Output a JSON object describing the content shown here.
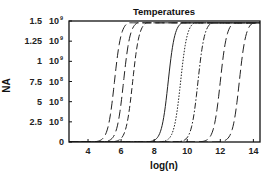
{
  "chart_data": {
    "type": "line",
    "title": "Temperatures",
    "xlabel": "log(n)",
    "ylabel": "NA",
    "xlim": [
      2.85,
      14.4
    ],
    "ylim": [
      0,
      1500000000
    ],
    "grid": false,
    "legend": null,
    "x_ticks": [
      {
        "value": 4,
        "label": "4"
      },
      {
        "value": 6,
        "label": "6"
      },
      {
        "value": 8,
        "label": "8"
      },
      {
        "value": 10,
        "label": "10"
      },
      {
        "value": 12,
        "label": "12"
      },
      {
        "value": 14,
        "label": "14"
      }
    ],
    "y_ticks": [
      {
        "value": 0,
        "mantissa": "0",
        "exponent": ""
      },
      {
        "value": 250000000,
        "mantissa": "2.5",
        "exponent": "8"
      },
      {
        "value": 500000000,
        "mantissa": "5",
        "exponent": "8"
      },
      {
        "value": 750000000,
        "mantissa": "7.5",
        "exponent": "8"
      },
      {
        "value": 1000000000,
        "mantissa": "1",
        "exponent": "9"
      },
      {
        "value": 1250000000,
        "mantissa": "1.25",
        "exponent": "9"
      },
      {
        "value": 1500000000,
        "mantissa": "1.5",
        "exponent": "9"
      }
    ],
    "series": [
      {
        "name": "curve-1",
        "midpoint": 5.6,
        "steepness": 5.0,
        "max": 1500000000,
        "style": "longdash"
      },
      {
        "name": "curve-2",
        "midpoint": 6.15,
        "steepness": 5.0,
        "max": 1500000000,
        "style": "longdash"
      },
      {
        "name": "curve-3",
        "midpoint": 6.7,
        "steepness": 5.0,
        "max": 1500000000,
        "style": "dash"
      },
      {
        "name": "curve-4",
        "midpoint": 8.85,
        "steepness": 5.0,
        "max": 1500000000,
        "style": "solid"
      },
      {
        "name": "curve-5",
        "midpoint": 9.6,
        "steepness": 5.0,
        "max": 1500000000,
        "style": "dotted"
      },
      {
        "name": "curve-6",
        "midpoint": 10.65,
        "steepness": 5.0,
        "max": 1500000000,
        "style": "dashdot"
      },
      {
        "name": "curve-7",
        "midpoint": 12.0,
        "steepness": 5.0,
        "max": 1500000000,
        "style": "longdash"
      },
      {
        "name": "curve-8",
        "midpoint": 13.15,
        "steepness": 5.0,
        "max": 1500000000,
        "style": "longdash"
      }
    ]
  },
  "layout": {
    "plot": {
      "left": 69,
      "top": 21,
      "right": 260,
      "bottom": 142
    },
    "line_color": "#222222",
    "axis_color": "#111111"
  }
}
